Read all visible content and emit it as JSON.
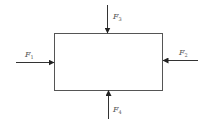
{
  "diagram": {
    "type": "free-body-diagram",
    "body": {
      "shape": "rectangle",
      "x": 54,
      "y": 33,
      "width": 108,
      "height": 57
    },
    "forces": [
      {
        "name": "F",
        "sub": "1",
        "direction": "right",
        "position": "left"
      },
      {
        "name": "F",
        "sub": "2",
        "direction": "left",
        "position": "right"
      },
      {
        "name": "F",
        "sub": "3",
        "direction": "down",
        "position": "top"
      },
      {
        "name": "F",
        "sub": "4",
        "direction": "up",
        "position": "bottom"
      }
    ],
    "colors": {
      "line": "#333333",
      "label": "#555555"
    }
  }
}
